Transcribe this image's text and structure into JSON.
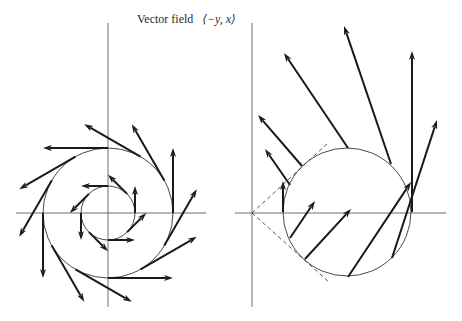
{
  "title": {
    "text": "Vector field",
    "math": "⟨−y, x⟩"
  },
  "colors": {
    "axis": "#6e6e6e",
    "arrow": "#1a1a1a",
    "circle": "#333333",
    "background": "#ffffff"
  },
  "left_panel": {
    "origin": [
      108,
      213
    ],
    "axes": {
      "horizontal": [
        16,
        206
      ],
      "vertical": [
        23,
        307
      ]
    },
    "circles": [
      {
        "r": 65,
        "arrow_count": 12
      },
      {
        "r": 27,
        "arrow_count": 8
      }
    ]
  },
  "right_panel": {
    "origin": [
      252,
      213
    ],
    "axes": {
      "horizontal": [
        235,
        446
      ],
      "vertical": [
        23,
        307
      ]
    },
    "circle": {
      "cx": 347,
      "cy": 212,
      "r": 64
    },
    "dashed_tangents": [
      [
        [
          252,
          213
        ],
        [
          327,
          144
        ]
      ],
      [
        [
          252,
          213
        ],
        [
          330,
          283
        ]
      ]
    ],
    "arrows": [
      [
        [
          283,
          212
        ],
        [
          283,
          181
        ]
      ],
      [
        [
          290,
          185
        ],
        [
          265,
          149
        ]
      ],
      [
        [
          302,
          166
        ],
        [
          258,
          115
        ]
      ],
      [
        [
          348,
          148
        ],
        [
          284,
          53
        ]
      ],
      [
        [
          391,
          164
        ],
        [
          344,
          26
        ]
      ],
      [
        [
          412,
          212
        ],
        [
          412,
          51
        ]
      ],
      [
        [
          392,
          258
        ],
        [
          437,
          120
        ]
      ],
      [
        [
          348,
          277
        ],
        [
          411,
          182
        ]
      ],
      [
        [
          305,
          259
        ],
        [
          351,
          209
        ]
      ],
      [
        [
          290,
          238
        ],
        [
          315,
          201
        ]
      ]
    ]
  }
}
